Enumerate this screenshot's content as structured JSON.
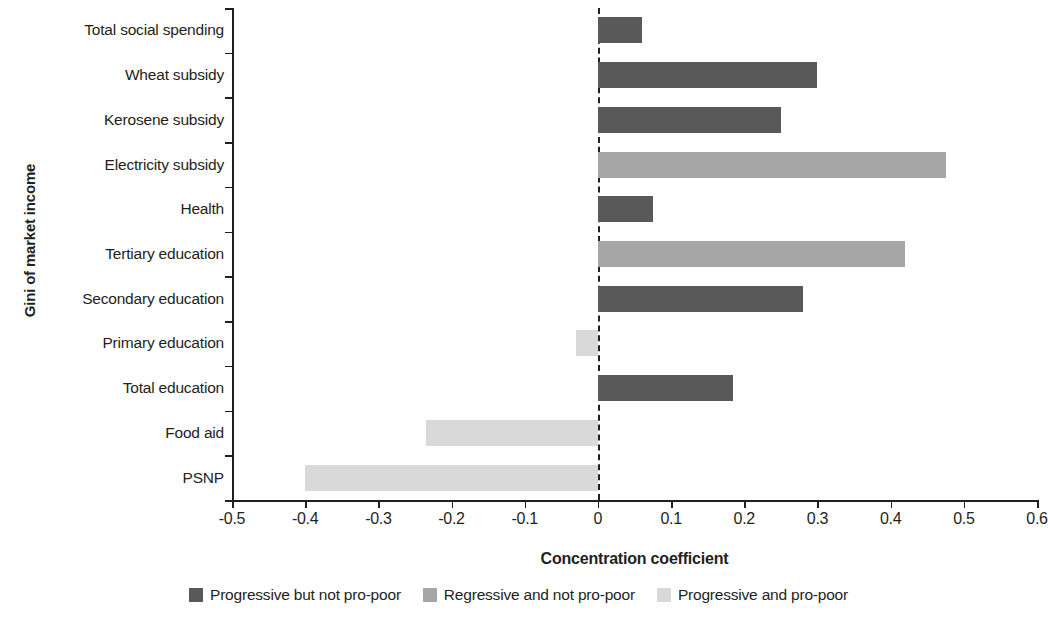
{
  "chart_data": {
    "type": "bar",
    "orientation": "horizontal",
    "title": "",
    "xlabel": "Concentration coefficient",
    "ylabel": "Gini of market income",
    "xlim": [
      -0.5,
      0.6
    ],
    "xticks": [
      "-0.5",
      "-0.4",
      "-0.3",
      "-0.2",
      "-0.1",
      "0",
      "0.1",
      "0.2",
      "0.3",
      "0.4",
      "0.5",
      "0.6"
    ],
    "xtick_values": [
      -0.5,
      -0.4,
      -0.3,
      -0.2,
      -0.1,
      0,
      0.1,
      0.2,
      0.3,
      0.4,
      0.5,
      0.6
    ],
    "grid": false,
    "reference_line": 0,
    "legend_position": "bottom",
    "categories": [
      "Total social spending",
      "Wheat subsidy",
      "Kerosene subsidy",
      "Electricity subsidy",
      "Health",
      "Tertiary education",
      "Secondary education",
      "Primary education",
      "Total education",
      "Food aid",
      "PSNP"
    ],
    "values": [
      0.06,
      0.3,
      0.25,
      0.475,
      0.075,
      0.42,
      0.28,
      -0.03,
      0.185,
      -0.235,
      -0.4
    ],
    "point_groups": [
      "Progressive but not pro-poor",
      "Progressive but not pro-poor",
      "Progressive but not pro-poor",
      "Regressive and not pro-poor",
      "Progressive but not pro-poor",
      "Regressive and not pro-poor",
      "Progressive but not pro-poor",
      "Progressive and pro-poor",
      "Progressive but not pro-poor",
      "Progressive and pro-poor",
      "Progressive and pro-poor"
    ],
    "series": [
      {
        "name": "Progressive but not pro-poor",
        "color": "#595959",
        "points": [
          {
            "category": "Total social spending",
            "value": 0.06
          },
          {
            "category": "Wheat subsidy",
            "value": 0.3
          },
          {
            "category": "Kerosene subsidy",
            "value": 0.25
          },
          {
            "category": "Health",
            "value": 0.075
          },
          {
            "category": "Secondary education",
            "value": 0.28
          },
          {
            "category": "Total education",
            "value": 0.185
          }
        ]
      },
      {
        "name": "Regressive and not pro-poor",
        "color": "#a6a6a6",
        "points": [
          {
            "category": "Electricity subsidy",
            "value": 0.475
          },
          {
            "category": "Tertiary education",
            "value": 0.42
          }
        ]
      },
      {
        "name": "Progressive and pro-poor",
        "color": "#d9d9d9",
        "points": [
          {
            "category": "Primary education",
            "value": -0.03
          },
          {
            "category": "Food aid",
            "value": -0.235
          },
          {
            "category": "PSNP",
            "value": -0.4
          }
        ]
      }
    ],
    "legend": [
      {
        "label": "Progressive but not pro-poor",
        "color": "#595959"
      },
      {
        "label": "Regressive and not pro-poor",
        "color": "#a6a6a6"
      },
      {
        "label": "Progressive and pro-poor",
        "color": "#d9d9d9"
      }
    ]
  }
}
